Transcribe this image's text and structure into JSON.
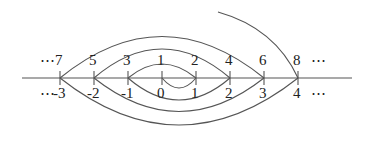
{
  "diagram": {
    "axis": {
      "x1": 22,
      "x2": 352,
      "y": 78
    },
    "ticks": [
      {
        "x": 60,
        "top": "7",
        "bottom": "-3"
      },
      {
        "x": 94,
        "top": "5",
        "bottom": "-2"
      },
      {
        "x": 128,
        "top": "3",
        "bottom": "-1"
      },
      {
        "x": 162,
        "top": "1",
        "bottom": "0"
      },
      {
        "x": 196,
        "top": "2",
        "bottom": "1"
      },
      {
        "x": 230,
        "top": "4",
        "bottom": "2"
      },
      {
        "x": 264,
        "top": "6",
        "bottom": "3"
      },
      {
        "x": 298,
        "top": "8",
        "bottom": "4"
      }
    ],
    "ellipsis": "⋯",
    "labels": {
      "top_left": "⋯ 7",
      "bottom_left": "⋯-3",
      "top_right_dots": "⋯",
      "bottom_right_dots": "⋯"
    }
  }
}
